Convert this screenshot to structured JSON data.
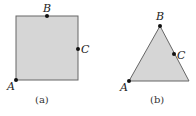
{
  "figures": [
    {
      "id": "a",
      "shape": "square",
      "caption": "(a)",
      "fill": "#d6d6d6",
      "stroke": "#666666",
      "points": {
        "A": {
          "label": "A",
          "x": 16,
          "y": 80
        },
        "B": {
          "label": "B",
          "x": 47,
          "y": 16
        },
        "C": {
          "label": "C",
          "x": 78,
          "y": 49
        }
      }
    },
    {
      "id": "b",
      "shape": "triangle",
      "caption": "(b)",
      "fill": "#d6d6d6",
      "stroke": "#666666",
      "points": {
        "A": {
          "label": "A",
          "x": 129,
          "y": 81
        },
        "B": {
          "label": "B",
          "x": 160,
          "y": 26
        },
        "C": {
          "label": "C",
          "x": 174,
          "y": 54
        }
      }
    }
  ]
}
